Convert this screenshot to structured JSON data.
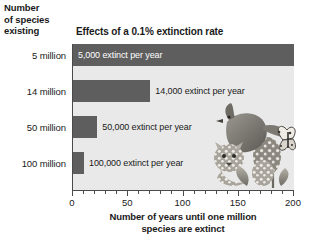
{
  "header": {
    "y_axis_header_line1": "Number",
    "y_axis_header_line2": "of species",
    "y_axis_header_line3": "existing"
  },
  "chart_data": {
    "type": "bar",
    "orientation": "horizontal",
    "title": "Effects of a 0.1% extinction rate",
    "xlabel_line1": "Number of years until one million",
    "xlabel_line2": "species are extinct",
    "ylabel": "Number of species existing",
    "categories": [
      "5 million",
      "14 million",
      "50 million",
      "100 million"
    ],
    "values": [
      200,
      70,
      22,
      10
    ],
    "bar_labels": [
      "5,000 extinct per year",
      "14,000 extinct per year",
      "50,000 extinct per year",
      "100,000 extinct per year"
    ],
    "xlim": [
      0,
      200
    ],
    "xticks": [
      0,
      50,
      100,
      150,
      200
    ],
    "xtick_labels": [
      "0",
      "50",
      "100",
      "150",
      "200"
    ],
    "minor_tick_step": 10,
    "grid": false,
    "legend": "none",
    "colors": {
      "bar": "#5e5e5e",
      "plot_background": "#e9e9e9",
      "axis": "#4a4a4a",
      "text": "#1a1a1a",
      "inside_label_text": "#ffffff"
    },
    "annotations": [
      {
        "name": "wildlife-illustration",
        "description": "grayscale illustration of a bird, a spotted wild cat, a butterfly and flowering plants overlaying the lower right of the plot"
      }
    ]
  }
}
